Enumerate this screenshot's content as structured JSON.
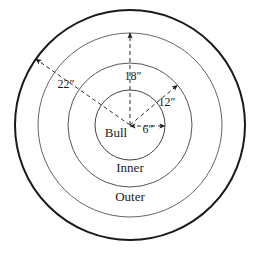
{
  "figure": {
    "center": {
      "x": 130,
      "y": 125
    },
    "stroke_color": "#1a1a1a",
    "ring_stroke_color": "#555555",
    "dash_color": "#333333"
  },
  "rings": [
    {
      "name": "bull",
      "label": "Bull",
      "radius_in": 6,
      "radius_px": 35,
      "stroke_width": 1.0
    },
    {
      "name": "inner-ring",
      "label": "",
      "radius_in": 12,
      "radius_px": 62,
      "stroke_width": 1.0
    },
    {
      "name": "outer-ring",
      "label": "Inner",
      "radius_in": 18,
      "radius_px": 92,
      "stroke_width": 1.0
    },
    {
      "name": "target-edge",
      "label": "Outer",
      "radius_in": 22,
      "radius_px": 115,
      "stroke_width": 2.0
    }
  ],
  "region_labels": [
    {
      "key": "bull",
      "text": "Bull",
      "x": 116,
      "y": 137
    },
    {
      "key": "inner",
      "text": "Inner",
      "x": 130,
      "y": 172
    },
    {
      "key": "outer",
      "text": "Outer",
      "x": 130,
      "y": 201
    }
  ],
  "dimensions": [
    {
      "key": "six",
      "text": "6″",
      "value": 6,
      "unit": "inches",
      "label_x": 148,
      "label_y": 133,
      "angle_deg": 0,
      "arrow": "double"
    },
    {
      "key": "twelve",
      "text": "12″",
      "value": 12,
      "unit": "inches",
      "label_x": 167,
      "label_y": 106,
      "angle_deg": -40,
      "arrow": "single"
    },
    {
      "key": "eighteen",
      "text": "18″",
      "value": 18,
      "unit": "inches",
      "label_x": 133,
      "label_y": 80,
      "angle_deg": -90,
      "arrow": "single"
    },
    {
      "key": "twentytwo",
      "text": "22″",
      "value": 22,
      "unit": "inches",
      "label_x": 66,
      "label_y": 88,
      "angle_deg": -145,
      "arrow": "single"
    }
  ]
}
